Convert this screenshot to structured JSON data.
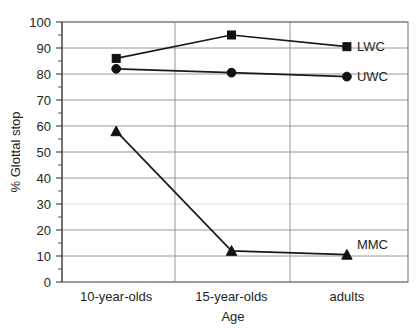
{
  "chart_data": {
    "type": "line",
    "title": "",
    "xlabel": "Age",
    "ylabel": "% Glottal stop",
    "categories": [
      "10-year-olds",
      "15-year-olds",
      "adults"
    ],
    "ylim": [
      0,
      100
    ],
    "yticks": [
      0,
      10,
      20,
      30,
      40,
      50,
      60,
      70,
      80,
      90,
      100
    ],
    "ytick_labels": [
      "0",
      "10",
      "20",
      "30",
      "40",
      "50",
      "60",
      "70",
      "80",
      "90",
      "100"
    ],
    "grid": true,
    "legend_position": "right-inline",
    "series": [
      {
        "name": "LWC",
        "marker": "square",
        "values": [
          86,
          95,
          90.5
        ]
      },
      {
        "name": "UWC",
        "marker": "circle",
        "values": [
          82,
          80.5,
          79
        ]
      },
      {
        "name": "MMC",
        "marker": "triangle",
        "values": [
          58,
          12,
          10.5
        ]
      }
    ],
    "colors": {
      "line": "#1a1a1a",
      "marker": "#111111",
      "grid": "#8c8c8c",
      "frame": "#6f6f6f",
      "text": "#231f20"
    }
  },
  "labels": {
    "y_axis_title": "% Glottal stop",
    "x_axis_title": "Age",
    "category_0": "10-year-olds",
    "category_1": "15-year-olds",
    "category_2": "adults",
    "series_0": "LWC",
    "series_1": "UWC",
    "series_2": "MMC",
    "ytick_0": "0",
    "ytick_1": "10",
    "ytick_2": "20",
    "ytick_3": "30",
    "ytick_4": "40",
    "ytick_5": "50",
    "ytick_6": "60",
    "ytick_7": "70",
    "ytick_8": "80",
    "ytick_9": "90",
    "ytick_10": "100"
  }
}
